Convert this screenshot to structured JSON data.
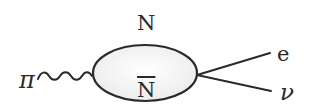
{
  "diagram": {
    "type": "feynman-diagram",
    "labels": {
      "incoming_particle": "π",
      "loop_top": "N",
      "loop_bottom": "N",
      "loop_bottom_note": "with overbar (antinucleon)",
      "outgoing_top": "e",
      "outgoing_bottom": "ν"
    },
    "elements": {
      "incoming_line_style": "wavy",
      "loop_shape": "ellipse",
      "outgoing_lines_style": "straight"
    },
    "colors": {
      "stroke": "#2a2a2a",
      "loop_fill": "#f2f2f2",
      "background": "#ffffff"
    }
  }
}
